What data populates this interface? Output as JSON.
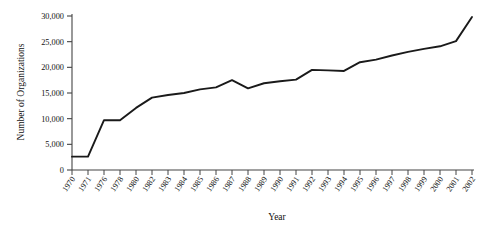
{
  "chart_data": {
    "type": "line",
    "title": "",
    "xlabel": "Year",
    "ylabel": "Number of Organizations",
    "categories": [
      "1970",
      "1971",
      "1976",
      "1978",
      "1980",
      "1982",
      "1983",
      "1984",
      "1985",
      "1986",
      "1987",
      "1988",
      "1989",
      "1990",
      "1991",
      "1992",
      "1993",
      "1994",
      "1995",
      "1996",
      "1997",
      "1998",
      "1999",
      "2000",
      "2001",
      "2002"
    ],
    "values": [
      2600,
      2600,
      9700,
      9700,
      12100,
      14100,
      14600,
      15000,
      15700,
      16100,
      17500,
      15900,
      16900,
      17300,
      17600,
      19500,
      19400,
      19300,
      21000,
      21500,
      22300,
      23000,
      23600,
      24100,
      25100,
      29800
    ],
    "ylim": [
      0,
      30000
    ],
    "yticks": [
      0,
      5000,
      10000,
      15000,
      20000,
      25000,
      30000
    ],
    "ytick_labels": [
      "0",
      "5,000",
      "10,000",
      "15,000",
      "20,000",
      "25,000",
      "30,000"
    ],
    "grid": false,
    "legend": "none",
    "line_color": "#1a1a1a",
    "axis_color": "#444444",
    "background": "#ffffff"
  },
  "axes": {
    "x_title": "Year",
    "y_title": "Number of Organizations"
  }
}
